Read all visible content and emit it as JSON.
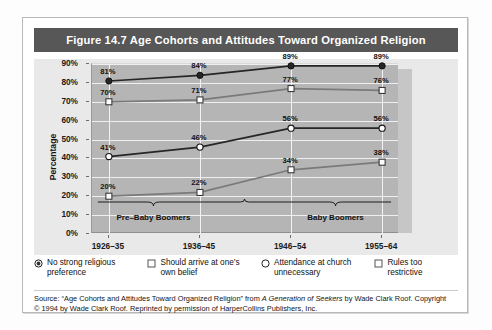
{
  "figure": {
    "title": "Figure 14.7  Age Cohorts and Attitudes Toward Organized Religion",
    "title_bg": "#575757",
    "title_color": "#ffffff"
  },
  "axis": {
    "y_title": "Percentage",
    "y_ticks": [
      "90%",
      "80%",
      "70%",
      "60%",
      "50%",
      "40%",
      "30%",
      "20%",
      "10%",
      "0%"
    ],
    "x_ticks": [
      "1926–35",
      "1936–45",
      "1946–54",
      "1955–64"
    ]
  },
  "annotations": {
    "bracket_left": "Pre–Baby Boomers",
    "bracket_right": "Baby Boomers"
  },
  "legend": {
    "items": [
      {
        "marker": "filled-dot-circle-marker",
        "label": "No strong religious preference"
      },
      {
        "marker": "open-square-marker",
        "label": "Should arrive at one’s own belief"
      },
      {
        "marker": "open-circle-marker",
        "label": "Attendance at church unnecessary"
      },
      {
        "marker": "open-square-marker",
        "label": "Rules too restrictive"
      }
    ]
  },
  "source": {
    "line1_a": "Source: “Age Cohorts and Attitudes Toward Organized Religion” from ",
    "line1_i": "A Generation of Seekers",
    "line1_b": " by Wade Clark Roof. Copyright",
    "line2": "© 1994 by Wade Clark Roof. Reprinted by permission of HarperCollins Publishers, Inc."
  },
  "chart_data": {
    "type": "line",
    "title": "Figure 14.7  Age Cohorts and Attitudes Toward Organized Religion",
    "xlabel": "",
    "ylabel": "Percentage",
    "categories": [
      "1926–35",
      "1936–45",
      "1946–54",
      "1955–64"
    ],
    "ylim": [
      0,
      90
    ],
    "ytick_step": 10,
    "grid": true,
    "legend_position": "bottom",
    "series": [
      {
        "name": "No strong religious preference",
        "values": [
          81,
          84,
          89,
          89
        ],
        "labels": [
          "81%",
          "84%",
          "89%",
          "89%"
        ],
        "color": "#262626",
        "marker": "filled-dot-circle-marker"
      },
      {
        "name": "Should arrive at one’s own belief",
        "values": [
          70,
          71,
          77,
          76
        ],
        "labels": [
          "70%",
          "71%",
          "77%",
          "76%"
        ],
        "color": "#7a7a7a",
        "marker": "open-square-marker"
      },
      {
        "name": "Attendance at church unnecessary",
        "values": [
          41,
          46,
          56,
          56
        ],
        "labels": [
          "41%",
          "46%",
          "56%",
          "56%"
        ],
        "color": "#262626",
        "marker": "open-circle-marker"
      },
      {
        "name": "Rules too restrictive",
        "values": [
          20,
          22,
          34,
          38
        ],
        "labels": [
          "20%",
          "22%",
          "34%",
          "38%"
        ],
        "color": "#7a7a7a",
        "marker": "open-square-marker"
      }
    ]
  }
}
